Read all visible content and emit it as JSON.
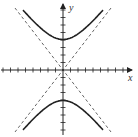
{
  "figure": {
    "type": "hyperbola-graph",
    "equation_form": "y^2/a^2 - x^2/b^2 = 1",
    "axes": {
      "x_label": "x",
      "y_label": "y",
      "x_ticks_each_side": 8,
      "y_ticks_each_side": 8
    },
    "curve": {
      "branches": [
        "upper",
        "lower"
      ],
      "vertex_units": 4,
      "style": "solid",
      "color": "#222222"
    },
    "asymptotes": {
      "count": 2,
      "style": "dashed",
      "color": "#555555"
    }
  }
}
